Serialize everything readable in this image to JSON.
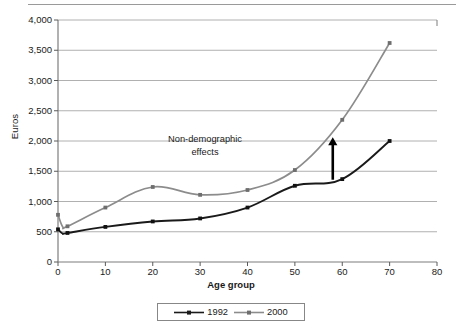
{
  "chart_data": {
    "type": "line",
    "title": "",
    "xlabel": "Age group",
    "ylabel": "Euros",
    "xlim": [
      0,
      80
    ],
    "ylim": [
      0,
      4000
    ],
    "grid": true,
    "legend_position": "bottom",
    "xticks": [
      "0",
      "10",
      "20",
      "30",
      "40",
      "50",
      "60",
      "70",
      "80"
    ],
    "xtick_values": [
      0,
      10,
      20,
      30,
      40,
      50,
      60,
      70,
      80
    ],
    "yticks": [
      "0",
      "500",
      "1,000",
      "1,500",
      "2,000",
      "2,500",
      "3,000",
      "3,500",
      "4,000"
    ],
    "ytick_values": [
      0,
      500,
      1000,
      1500,
      2000,
      2500,
      3000,
      3500,
      4000
    ],
    "x": [
      0,
      1,
      2,
      10,
      20,
      30,
      40,
      50,
      60,
      70
    ],
    "series": [
      {
        "name": "1992",
        "color": "#1a1a1a",
        "values": [
          540,
          470,
          480,
          580,
          670,
          720,
          900,
          1260,
          1370,
          2000
        ]
      },
      {
        "name": "2000",
        "color": "#8c8c8c",
        "values": [
          780,
          580,
          590,
          900,
          1240,
          1110,
          1190,
          1520,
          2350,
          3620
        ]
      }
    ],
    "annotations": [
      {
        "name": "non-demographic-effects",
        "text_line1": "Non-demographic",
        "text_line2": "effects",
        "arrow": {
          "x": 58,
          "y_from": 1360,
          "y_to": 2060,
          "direction": "up",
          "color": "#000000"
        }
      }
    ]
  },
  "legend": {
    "entries": [
      {
        "label": "1992",
        "color": "#1a1a1a"
      },
      {
        "label": "2000",
        "color": "#8c8c8c"
      }
    ]
  },
  "axis": {
    "ylabel": "Euros",
    "xlabel": "Age group"
  }
}
